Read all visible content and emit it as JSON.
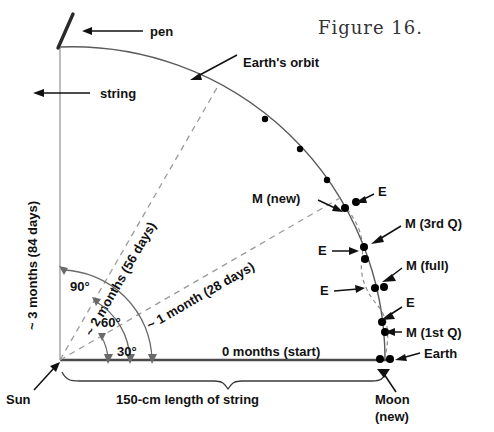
{
  "figure": {
    "title": "Figure 16.",
    "caption_labels": {
      "pen": "pen",
      "string": "string",
      "earths_orbit": "Earth's orbit",
      "three_months": "~ 3 months (84 days)",
      "two_months": "~ 2 months (56 days)",
      "one_month": "~ 1 month (28 days)",
      "zero_months": "0 months (start)",
      "sun": "Sun",
      "string_length": "150-cm length of string",
      "moon_new_bottom_line1": "Moon",
      "moon_new_bottom_line2": "(new)",
      "earth": "Earth"
    },
    "angles": [
      "90°",
      "60°",
      "30°"
    ],
    "orbit_markers": [
      {
        "name": "m-new",
        "label": "M (new)"
      },
      {
        "name": "e-near-new",
        "label": "E"
      },
      {
        "name": "m-third-q",
        "label": "M (3rd Q)"
      },
      {
        "name": "e-near-third-q",
        "label": "E"
      },
      {
        "name": "m-full",
        "label": "M (full)"
      },
      {
        "name": "e-near-full",
        "label": "E"
      },
      {
        "name": "e-near-first-q",
        "label": "E"
      },
      {
        "name": "m-first-q",
        "label": "M (1st Q)"
      }
    ],
    "colors": {
      "ink": "#111111",
      "orbit_line": "#5b5b5b",
      "dashed_line": "#9a9a9a",
      "axis": "#4a4a4a",
      "background": "#ffffff"
    }
  }
}
